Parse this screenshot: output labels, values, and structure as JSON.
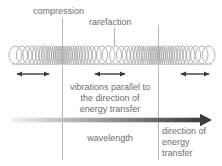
{
  "diagram": {
    "width": 222,
    "height": 166,
    "background": "#ffffff"
  },
  "labels": {
    "compression": "compression",
    "rarefaction": "rarefaction",
    "wavelength": "wavelength"
  },
  "vibration_note": {
    "line1": "vibrations parallel to",
    "line2": "the direction of",
    "line3": "energy transfer"
  },
  "energy_note": {
    "line1": "direction of",
    "line2": "energy",
    "line3": "transfer"
  },
  "colors": {
    "text": "#6e6e6e",
    "coil": "#9a9a9a",
    "guide_line": "#b9b9b9",
    "leader_line": "#b0b0b0",
    "arrow": "#3a3a3a",
    "energy_arrow_start": "#f2f2f2",
    "energy_arrow_end": "#3a3a3a",
    "baseline": "#c2c2c2"
  },
  "chart_data": {
    "type": "line",
    "xlabel": "",
    "ylabel": "",
    "grid": false,
    "legend": "none",
    "annotations": [
      {
        "text": "compression",
        "x": 62,
        "y": 12,
        "leader_to_x": 62,
        "leader_to_y": 42
      },
      {
        "text": "rarefaction",
        "x": 114,
        "y": 23,
        "leader_to_x": 114,
        "leader_to_y": 46
      },
      {
        "text": "vibrations parallel to the direction of energy transfer",
        "x": 110,
        "y": 98
      },
      {
        "text": "wavelength",
        "x": 110,
        "y": 139
      },
      {
        "text": "direction of energy transfer",
        "x": 190,
        "y": 142
      }
    ],
    "coil": {
      "x_start": 12,
      "x_end": 212,
      "y_top": 46,
      "y_bottom": 64,
      "compression_centers": [
        62,
        158
      ],
      "rarefaction_centers": [
        114
      ],
      "wavelength_px": 96,
      "loop_count": 62
    },
    "vibration_arrows": [
      {
        "x1": 14,
        "x2": 52,
        "y": 74,
        "double_headed": true
      },
      {
        "x1": 92,
        "x2": 128,
        "y": 74,
        "double_headed": true
      },
      {
        "x1": 178,
        "x2": 212,
        "y": 74,
        "double_headed": true
      }
    ],
    "energy_arrow": {
      "x1": 10,
      "x2": 212,
      "y": 120,
      "double_headed": false,
      "gradient": [
        "#f2f2f2",
        "#3a3a3a"
      ]
    },
    "guide_lines": [
      {
        "x": 62,
        "y1": 25,
        "y2": 160
      },
      {
        "x": 158,
        "y1": 25,
        "y2": 160
      }
    ]
  }
}
